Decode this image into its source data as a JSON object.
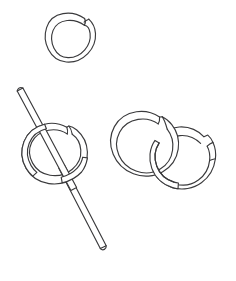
{
  "canvas": {
    "width": 236,
    "height": 281,
    "background_color": "#ffffff",
    "line_color": "#3a3a3c",
    "line_width": 1.15,
    "style": "black-and-white line drawing / contour sketch"
  },
  "scene": {
    "title": "Line drawing of three split rings and a rod",
    "object_count": 4,
    "objects": [
      {
        "id": "ring-top",
        "name": "split-ring-top",
        "label": "Top split ring",
        "shape": "open ring / jump ring",
        "center_x": 71,
        "center_y": 37,
        "outer_radius": 25,
        "inner_radius": 17.5,
        "tube_thickness": 7.5,
        "gap_angle_deg": -60,
        "gap_position": "upper right",
        "depth_order": 1
      },
      {
        "id": "ring-threaded",
        "name": "split-ring-threaded",
        "label": "Middle split ring threaded on rod",
        "shape": "open ring / jump ring",
        "center_x": 54,
        "center_y": 154,
        "outer_radius": 31,
        "inner_radius": 22.5,
        "tube_thickness": 8.5,
        "gap_angle_deg": -62,
        "gap_position": "upper right",
        "depth_order": 2
      },
      {
        "id": "rod",
        "name": "rod-through-ring",
        "label": "Rod passing through middle ring",
        "shape": "long slender rod / stick",
        "start_x": 20,
        "start_y": 94,
        "end_x": 103,
        "end_y": 250,
        "thickness": 7,
        "angle_deg": 62,
        "depth_order": 3,
        "relation": "passes through ring-threaded, in front at center"
      },
      {
        "id": "ring-pair-left",
        "name": "split-ring-linked-left",
        "label": "Left ring of interlocked pair",
        "shape": "open ring / jump ring",
        "center_x": 145,
        "center_y": 143,
        "outer_radius": 30,
        "inner_radius": 21.5,
        "tube_thickness": 8.5,
        "gap_angle_deg": -58,
        "gap_position": "upper right",
        "depth_order": 4,
        "relation": "interlocked with ring-pair-right"
      },
      {
        "id": "ring-pair-right",
        "name": "split-ring-linked-right",
        "label": "Right ring of interlocked pair",
        "shape": "open ring / jump ring",
        "center_x": 188,
        "center_y": 157,
        "outer_radius": 30,
        "inner_radius": 21.5,
        "tube_thickness": 8.5,
        "gap_angle_deg": 32,
        "gap_position": "lower right",
        "depth_order": 5,
        "relation": "interlocked with ring-pair-left, passes behind at top-left and in front at bottom"
      }
    ]
  }
}
